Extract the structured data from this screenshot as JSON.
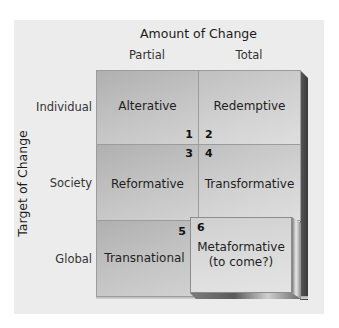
{
  "diagram": {
    "x_axis_title": "Amount of Change",
    "y_axis_title": "Target of Change",
    "columns": [
      "Partial",
      "Total"
    ],
    "rows": [
      "Individual",
      "Society",
      "Global"
    ],
    "cells": [
      {
        "id": 1,
        "row": "Individual",
        "column": "Partial",
        "label": "Alterative",
        "number": "1"
      },
      {
        "id": 2,
        "row": "Individual",
        "column": "Total",
        "label": "Redemptive",
        "number": "2"
      },
      {
        "id": 3,
        "row": "Society",
        "column": "Partial",
        "label": "Reformative",
        "number": "3"
      },
      {
        "id": 4,
        "row": "Society",
        "column": "Total",
        "label": "Transformative",
        "number": "4"
      },
      {
        "id": 5,
        "row": "Global",
        "column": "Partial",
        "label": "Transnational",
        "number": "5"
      },
      {
        "id": 6,
        "row": "Global",
        "column": "Total",
        "label": "Metaformative",
        "sublabel": "(to come?)",
        "number": "6"
      }
    ],
    "colors": {
      "panel_bg": "#ececec",
      "cell_dark": "#b8b8b8",
      "cell_light": "#d4d4d4",
      "extrusion": "#454545",
      "text": "#1e1e1e"
    }
  }
}
